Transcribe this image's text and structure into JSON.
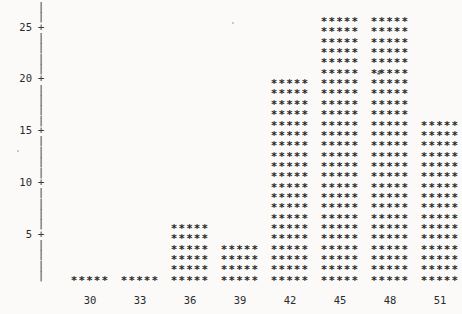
{
  "chart_data": {
    "type": "bar",
    "title": "",
    "subtitle": "",
    "xlabel": "",
    "ylabel": "",
    "categories": [
      "30",
      "33",
      "36",
      "39",
      "42",
      "45",
      "48",
      "51"
    ],
    "values": [
      1,
      1,
      6,
      4,
      20,
      26,
      26,
      16
    ],
    "x": [
      30,
      33,
      36,
      39,
      42,
      45,
      48,
      51
    ],
    "xlim": [
      28.5,
      52.5
    ],
    "ylim": [
      0,
      27
    ],
    "y_ticks": [
      5,
      10,
      15,
      20,
      25
    ],
    "y_tick_labels": [
      "5",
      "10",
      "15",
      "20",
      "25"
    ],
    "x_ticks": [
      30,
      33,
      36,
      39,
      42,
      45,
      48,
      51
    ],
    "x_tick_labels": [
      "30",
      "33",
      "36",
      "39",
      "42",
      "45",
      "48",
      "51"
    ],
    "grid": false,
    "legend": null,
    "style": "ascii-art",
    "marker_glyph": "*",
    "bar_glyph_width": 5
  },
  "axes": {
    "y_axis": {
      "name": "y-axis",
      "spine_glyph": "|",
      "tick_glyph": "+",
      "ticks": [
        {
          "value": 25,
          "label": "25"
        },
        {
          "value": 20,
          "label": "20"
        },
        {
          "value": 15,
          "label": "15"
        },
        {
          "value": 10,
          "label": "10"
        },
        {
          "value": 5,
          "label": "5"
        }
      ]
    },
    "x_axis": {
      "name": "x-axis",
      "line_glyph": "-",
      "ticks": [
        {
          "value": 30,
          "label": "30"
        },
        {
          "value": 33,
          "label": "33"
        },
        {
          "value": 36,
          "label": "36"
        },
        {
          "value": 39,
          "label": "39"
        },
        {
          "value": 42,
          "label": "42"
        },
        {
          "value": 45,
          "label": "45"
        },
        {
          "value": 48,
          "label": "48"
        },
        {
          "value": 51,
          "label": "51"
        }
      ]
    }
  },
  "bars": [
    {
      "label": "30",
      "count": 1,
      "glyphs": "*****"
    },
    {
      "label": "33",
      "count": 1,
      "glyphs": "*****"
    },
    {
      "label": "36",
      "count": 6,
      "glyphs": "*****"
    },
    {
      "label": "39",
      "count": 4,
      "glyphs": "*****"
    },
    {
      "label": "42",
      "count": 20,
      "glyphs": "*****"
    },
    {
      "label": "45",
      "count": 26,
      "glyphs": "*****"
    },
    {
      "label": "48",
      "count": 26,
      "glyphs": "*****"
    },
    {
      "label": "51",
      "count": 16,
      "glyphs": "*****"
    }
  ],
  "colors": {
    "background": "#fbfaf8",
    "ink": "#262626",
    "axis": "#3a3a3a",
    "speck": "#b9b9b5"
  },
  "artifacts": {
    "stray_mark": "#"
  }
}
